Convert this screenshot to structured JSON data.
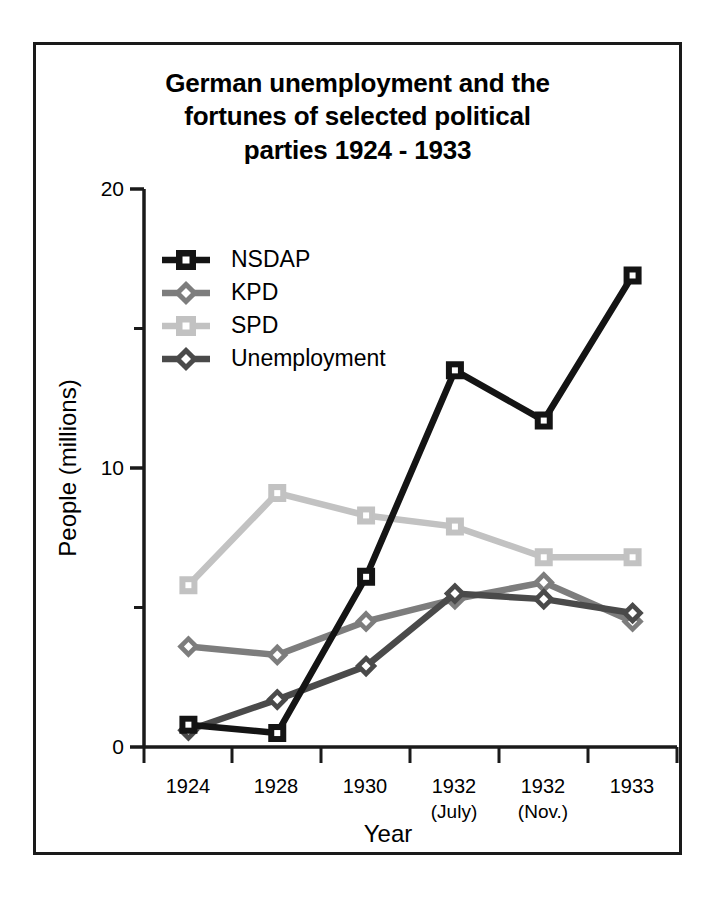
{
  "figure": {
    "title_lines": [
      "German unemployment and the",
      "fortunes of selected political",
      "parties 1924 - 1933"
    ],
    "border_color": "#1a1a1a",
    "background": "#ffffff"
  },
  "axes": {
    "x_title": "Year",
    "y_title": "People (millions)",
    "y_tick_labels": [
      "0",
      "10",
      "20"
    ],
    "x_tick_labels_primary": [
      "1924",
      "1928",
      "1930",
      "1932",
      "1932",
      "1933"
    ],
    "x_tick_labels_secondary": [
      "",
      "",
      "",
      "(July)",
      "(Nov.)",
      ""
    ]
  },
  "legend": {
    "items": [
      {
        "label": "NSDAP",
        "color": "#141414",
        "marker": "square"
      },
      {
        "label": "KPD",
        "color": "#7d7d7d",
        "marker": "diamond"
      },
      {
        "label": "SPD",
        "color": "#c2c2c2",
        "marker": "square"
      },
      {
        "label": "Unemployment",
        "color": "#4a4a4a",
        "marker": "diamond"
      }
    ]
  },
  "chart_data": {
    "type": "line",
    "title": "German unemployment and the fortunes of selected political parties 1924 - 1933",
    "xlabel": "Year",
    "ylabel": "People (millions)",
    "categories": [
      "1924",
      "1928",
      "1930",
      "1932 (July)",
      "1932 (Nov.)",
      "1933"
    ],
    "ylim": [
      0,
      20
    ],
    "yticks": [
      0,
      10,
      20
    ],
    "yminorticks": [
      5,
      15
    ],
    "grid": false,
    "legend_position": "upper-left-inside",
    "series": [
      {
        "name": "NSDAP",
        "color": "#141414",
        "marker": "square",
        "values": [
          0.8,
          0.5,
          6.1,
          13.5,
          11.7,
          16.9
        ]
      },
      {
        "name": "KPD",
        "color": "#7d7d7d",
        "marker": "diamond",
        "values": [
          3.6,
          3.3,
          4.5,
          5.3,
          5.9,
          4.5
        ]
      },
      {
        "name": "SPD",
        "color": "#c2c2c2",
        "marker": "square",
        "values": [
          5.8,
          9.1,
          8.3,
          7.9,
          6.8,
          6.8
        ]
      },
      {
        "name": "Unemployment",
        "color": "#4a4a4a",
        "marker": "diamond",
        "values": [
          0.6,
          1.7,
          2.9,
          5.5,
          5.3,
          4.8
        ]
      }
    ]
  }
}
